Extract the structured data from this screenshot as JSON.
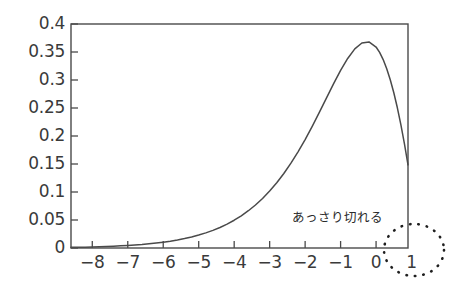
{
  "chart_data": {
    "type": "line",
    "title": "",
    "subtitle": "",
    "xlabel": "",
    "ylabel": "",
    "xlim": [
      -8.6,
      0.9
    ],
    "ylim": [
      0,
      0.4
    ],
    "grid": false,
    "legend": null,
    "legend_position": "none",
    "x_ticks": [
      -8,
      -7,
      -6,
      -5,
      -4,
      -3,
      -2,
      -1,
      0,
      1
    ],
    "x_tick_labels": [
      "−8",
      "−7",
      "−6",
      "−5",
      "−4",
      "−3",
      "−2",
      "−1",
      "0",
      "1"
    ],
    "y_ticks": [
      0,
      0.05,
      0.1,
      0.15,
      0.2,
      0.25,
      0.3,
      0.35,
      0.4
    ],
    "y_tick_labels": [
      "0",
      "0.05",
      "0.1",
      "0.15",
      "0.2",
      "0.25",
      "0.3",
      "0.35",
      "0.4"
    ],
    "series": [
      {
        "name": "curve",
        "color": "#4a4a4a",
        "x": [
          -8.6,
          -8.4,
          -8.2,
          -8.0,
          -7.8,
          -7.6,
          -7.4,
          -7.2,
          -7.0,
          -6.8,
          -6.6,
          -6.4,
          -6.2,
          -6.0,
          -5.8,
          -5.6,
          -5.4,
          -5.2,
          -5.0,
          -4.8,
          -4.6,
          -4.4,
          -4.2,
          -4.0,
          -3.8,
          -3.6,
          -3.4,
          -3.2,
          -3.0,
          -2.8,
          -2.6,
          -2.4,
          -2.2,
          -2.0,
          -1.8,
          -1.6,
          -1.4,
          -1.2,
          -1.0,
          -0.8,
          -0.6,
          -0.4,
          -0.2,
          0.0,
          0.1,
          0.2,
          0.3,
          0.4,
          0.5,
          0.6,
          0.7,
          0.8,
          0.9
        ],
        "y": [
          0.0016,
          0.0019,
          0.0022,
          0.0027,
          0.0032,
          0.0038,
          0.0045,
          0.0054,
          0.0064,
          0.0076,
          0.0089,
          0.0106,
          0.0125,
          0.0147,
          0.0173,
          0.0203,
          0.0238,
          0.0279,
          0.0327,
          0.0382,
          0.0446,
          0.0519,
          0.0604,
          0.0702,
          0.0814,
          0.0942,
          0.1088,
          0.1253,
          0.144,
          0.165,
          0.1884,
          0.2144,
          0.243,
          0.2741,
          0.3075,
          0.3427,
          0.3788,
          0.4147,
          0.4488,
          0.4791,
          0.5032,
          0.5182,
          0.5209,
          0.508,
          0.4944,
          0.4762,
          0.4533,
          0.4254,
          0.3925,
          0.3544,
          0.3113,
          0.2631,
          0.2101
        ],
        "y_scale_note": "values normalised to peak 0.368 at x = 0",
        "peak": {
          "x": 0,
          "y": 0.368
        }
      }
    ],
    "annotations": [
      {
        "id": "cutoff-note",
        "text": "あっさり切れる",
        "x_px": 292,
        "y_px": 211,
        "kind": "text"
      },
      {
        "id": "cutoff-ellipse",
        "kind": "dotted-ellipse",
        "cx_px": 414,
        "cy_px": 250,
        "rx_px": 30,
        "ry_px": 26,
        "style": "dotted",
        "color": "#1f1f1f"
      }
    ],
    "axes_style": {
      "frame": "box",
      "frame_color": "#4a4a4a",
      "tick_direction": "in",
      "background": "#ffffff"
    }
  },
  "figure": {
    "background_color": "#ffffff",
    "line_color": "#4a4a4a",
    "text_color": "#3a3a3a"
  }
}
